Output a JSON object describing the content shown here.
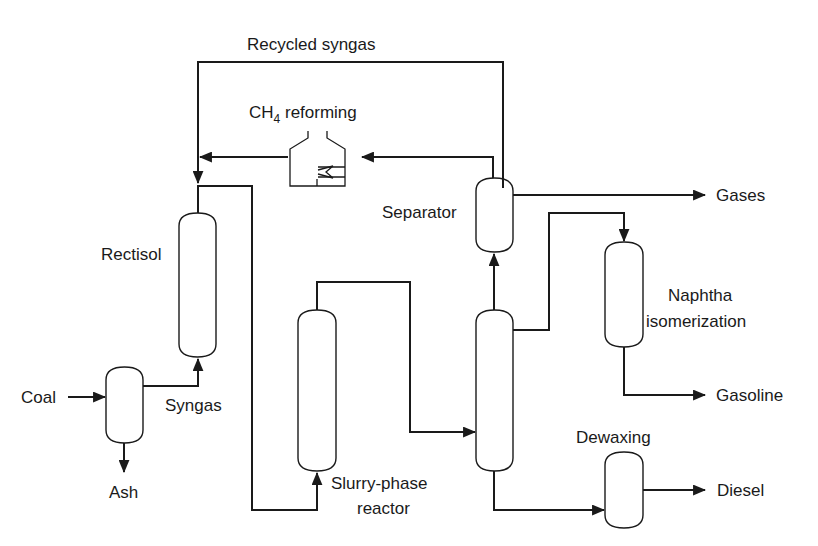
{
  "diagram": {
    "colors": {
      "line": "#1a1a1a",
      "background": "#ffffff"
    },
    "labels": {
      "recycled_syngas": "Recycled syngas",
      "ch4_reforming_prefix": "CH",
      "ch4_reforming_sub": "4",
      "ch4_reforming_suffix": " reforming",
      "rectisol": "Rectisol",
      "separator": "Separator",
      "gases": "Gases",
      "naphtha": "Naphtha",
      "isomerization": "isomerization",
      "coal": "Coal",
      "syngas": "Syngas",
      "ash": "Ash",
      "gasoline": "Gasoline",
      "slurry_phase": "Slurry-phase",
      "reactor": "reactor",
      "dewaxing": "Dewaxing",
      "diesel": "Diesel"
    },
    "units": [
      {
        "id": "gasifier",
        "label": ""
      },
      {
        "id": "rectisol",
        "label": "Rectisol"
      },
      {
        "id": "ch4-reformer",
        "label": "CH4 reforming"
      },
      {
        "id": "slurry-phase-reactor",
        "label": "Slurry-phase reactor"
      },
      {
        "id": "fractionator",
        "label": ""
      },
      {
        "id": "separator",
        "label": "Separator"
      },
      {
        "id": "naphtha-isomerization",
        "label": "Naphtha isomerization"
      },
      {
        "id": "dewaxing",
        "label": "Dewaxing"
      }
    ],
    "streams": [
      {
        "from": "Coal",
        "to": "gasifier"
      },
      {
        "from": "gasifier",
        "to": "Ash"
      },
      {
        "from": "gasifier",
        "to": "rectisol",
        "label": "Syngas"
      },
      {
        "from": "rectisol",
        "to": "slurry-phase-reactor"
      },
      {
        "from": "slurry-phase-reactor",
        "to": "fractionator"
      },
      {
        "from": "fractionator",
        "to": "separator"
      },
      {
        "from": "separator",
        "to": "Gases"
      },
      {
        "from": "separator",
        "to": "ch4-reformer"
      },
      {
        "from": "ch4-reformer",
        "to": "rectisol"
      },
      {
        "from": "separator",
        "to": "rectisol",
        "label": "Recycled syngas"
      },
      {
        "from": "fractionator",
        "to": "naphtha-isomerization"
      },
      {
        "from": "naphtha-isomerization",
        "to": "Gasoline"
      },
      {
        "from": "fractionator",
        "to": "dewaxing"
      },
      {
        "from": "dewaxing",
        "to": "Diesel"
      }
    ]
  }
}
